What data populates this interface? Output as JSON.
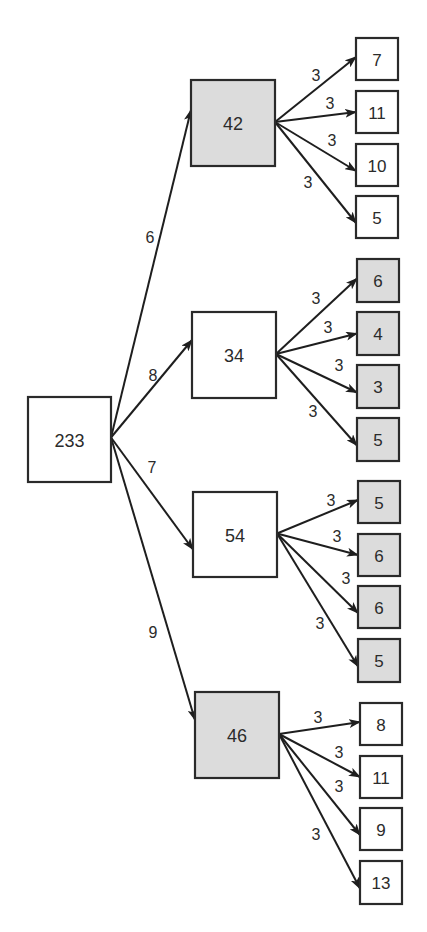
{
  "colors": {
    "shaded_fill": "#dcdcdc",
    "plain_fill": "#ffffff",
    "stroke": "#2a2a2a"
  },
  "tree": {
    "root": {
      "value": "233",
      "shaded": false,
      "box": [
        28,
        397,
        83,
        85
      ]
    },
    "branches": [
      {
        "value": "42",
        "shaded": true,
        "box": [
          191,
          80,
          84,
          86
        ],
        "edge_weight": "6",
        "edge_label_pos": [
          150,
          237
        ],
        "children": [
          {
            "value": "7",
            "shaded": false,
            "box": [
              356,
              38,
              42,
              42
            ],
            "edge_weight": "3",
            "edge_label_pos": [
              316,
              75
            ]
          },
          {
            "value": "11",
            "shaded": false,
            "box": [
              356,
              91,
              42,
              42
            ],
            "edge_weight": "3",
            "edge_label_pos": [
              330,
              103
            ]
          },
          {
            "value": "10",
            "shaded": false,
            "box": [
              356,
              144,
              42,
              42
            ],
            "edge_weight": "3",
            "edge_label_pos": [
              332,
              140
            ]
          },
          {
            "value": "5",
            "shaded": false,
            "box": [
              356,
              196,
              42,
              42
            ],
            "edge_weight": "3",
            "edge_label_pos": [
              308,
              182
            ]
          }
        ]
      },
      {
        "value": "34",
        "shaded": false,
        "box": [
          192,
          312,
          84,
          86
        ],
        "edge_weight": "8",
        "edge_label_pos": [
          153,
          375
        ],
        "children": [
          {
            "value": "6",
            "shaded": true,
            "box": [
              357,
              259,
              42,
              43
            ],
            "edge_weight": "3",
            "edge_label_pos": [
              316,
              298
            ]
          },
          {
            "value": "4",
            "shaded": true,
            "box": [
              357,
              312,
              42,
              43
            ],
            "edge_weight": "3",
            "edge_label_pos": [
              328,
              327
            ]
          },
          {
            "value": "3",
            "shaded": true,
            "box": [
              357,
              365,
              42,
              43
            ],
            "edge_weight": "3",
            "edge_label_pos": [
              339,
              365
            ]
          },
          {
            "value": "5",
            "shaded": true,
            "box": [
              357,
              418,
              42,
              43
            ],
            "edge_weight": "3",
            "edge_label_pos": [
              313,
              411
            ]
          }
        ]
      },
      {
        "value": "54",
        "shaded": false,
        "box": [
          193,
          492,
          84,
          85
        ],
        "edge_weight": "7",
        "edge_label_pos": [
          152,
          467
        ],
        "children": [
          {
            "value": "5",
            "shaded": true,
            "box": [
              358,
              481,
              42,
              42
            ],
            "edge_weight": "3",
            "edge_label_pos": [
              331,
              500
            ]
          },
          {
            "value": "6",
            "shaded": true,
            "box": [
              358,
              534,
              42,
              42
            ],
            "edge_weight": "3",
            "edge_label_pos": [
              337,
              536
            ]
          },
          {
            "value": "6",
            "shaded": true,
            "box": [
              358,
              586,
              42,
              42
            ],
            "edge_weight": "3",
            "edge_label_pos": [
              346,
              578
            ]
          },
          {
            "value": "5",
            "shaded": true,
            "box": [
              358,
              639,
              42,
              43
            ],
            "edge_weight": "3",
            "edge_label_pos": [
              320,
              623
            ]
          }
        ]
      },
      {
        "value": "46",
        "shaded": true,
        "box": [
          195,
          692,
          84,
          86
        ],
        "edge_weight": "9",
        "edge_label_pos": [
          153,
          632
        ],
        "children": [
          {
            "value": "8",
            "shaded": false,
            "box": [
              360,
              703,
              42,
              42
            ],
            "edge_weight": "3",
            "edge_label_pos": [
              318,
              717
            ]
          },
          {
            "value": "11",
            "shaded": false,
            "box": [
              360,
              756,
              42,
              42
            ],
            "edge_weight": "3",
            "edge_label_pos": [
              339,
              752
            ]
          },
          {
            "value": "9",
            "shaded": false,
            "box": [
              360,
              808,
              42,
              42
            ],
            "edge_weight": "3",
            "edge_label_pos": [
              339,
              786
            ]
          },
          {
            "value": "13",
            "shaded": false,
            "box": [
              360,
              861,
              42,
              43
            ],
            "edge_weight": "3",
            "edge_label_pos": [
              316,
              834
            ]
          }
        ]
      }
    ]
  }
}
